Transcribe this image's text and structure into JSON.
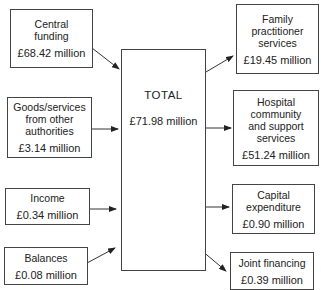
{
  "diagram": {
    "type": "flow",
    "center": {
      "label": "TOTAL",
      "amount": "£71.98 million"
    },
    "inputs": [
      {
        "label": "Central funding",
        "lines": [
          "Central",
          "funding"
        ],
        "amount": "£68.42 million"
      },
      {
        "label": "Goods/services from other authorities",
        "lines": [
          "Goods/services",
          "from other",
          "authorities"
        ],
        "amount": "£3.14 million"
      },
      {
        "label": "Income",
        "lines": [
          "Income"
        ],
        "amount": "£0.34 million"
      },
      {
        "label": "Balances",
        "lines": [
          "Balances"
        ],
        "amount": "£0.08 million"
      }
    ],
    "outputs": [
      {
        "label": "Family practitioner services",
        "lines": [
          "Family",
          "practitioner",
          "services"
        ],
        "amount": "£19.45 million"
      },
      {
        "label": "Hospital community and support services",
        "lines": [
          "Hospital",
          "community",
          "and support",
          "services"
        ],
        "amount": "£51.24 million"
      },
      {
        "label": "Capital expenditure",
        "lines": [
          "Capital",
          "expenditure"
        ],
        "amount": "£0.90 million"
      },
      {
        "label": "Joint financing",
        "lines": [
          "Joint financing"
        ],
        "amount": "£0.39 million"
      }
    ],
    "colors": {
      "line": "#444444",
      "text": "#222222",
      "background": "#ffffff"
    }
  }
}
